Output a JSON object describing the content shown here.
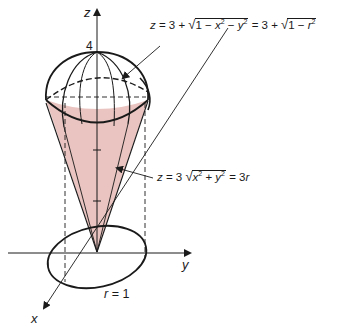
{
  "figure": {
    "axes": {
      "z_label": "z",
      "y_label": "y",
      "x_label": "x",
      "z_tick_label": "4"
    },
    "sphere_equation": {
      "lhs": "z = 3 + ",
      "radicand1_a": "1 − x",
      "radicand1_b": " − y",
      "exp": "2",
      "middle": " = 3 + ",
      "radicand2": "1 − r",
      "full_text": "z = 3 + √(1 − x² − y²) = 3 + √(1 − r²)"
    },
    "cone_equation": {
      "lhs": "z = 3 ",
      "radicand_a": "x",
      "radicand_b": " + y",
      "exp": "2",
      "rhs": " = 3r",
      "full_text": "z = 3√(x² + y²) = 3r"
    },
    "base_label": "r = 1",
    "colors": {
      "cone_fill": "#e9c4c0",
      "stroke": "#1a1a1a",
      "background": "#ffffff"
    }
  }
}
